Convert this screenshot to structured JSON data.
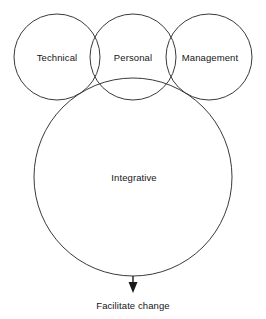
{
  "diagram": {
    "type": "venn-flow",
    "background_color": "#ffffff",
    "stroke_color": "#3a3a3a",
    "text_color": "#161616",
    "circles": [
      {
        "id": "technical",
        "label": "Technical",
        "cx": 57,
        "cy": 57,
        "r": 43,
        "label_x": 57,
        "label_y": 58
      },
      {
        "id": "personal",
        "label": "Personal",
        "cx": 133,
        "cy": 57,
        "r": 43,
        "label_x": 133,
        "label_y": 58
      },
      {
        "id": "management",
        "label": "Management",
        "cx": 209,
        "cy": 57,
        "r": 43,
        "label_x": 210,
        "label_y": 58
      },
      {
        "id": "integrative",
        "label": "Integrative",
        "cx": 133,
        "cy": 177,
        "r": 99,
        "label_x": 134,
        "label_y": 178
      }
    ],
    "arrow": {
      "name": "facilitate-change-arrow",
      "x": 133,
      "y_start": 276,
      "y_end": 293,
      "head_width": 9,
      "head_height": 11
    },
    "outcome": {
      "label": "Facilitate change",
      "x": 133,
      "y": 306
    }
  }
}
